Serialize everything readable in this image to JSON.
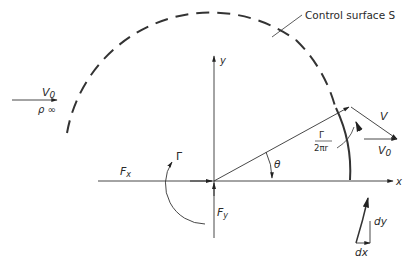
{
  "diagram": {
    "labels": {
      "control_surface": "Control surface S",
      "freestream_velocity": "V",
      "freestream_velocity_sub": "0",
      "freestream_density": "ρ ∞",
      "y_axis": "y",
      "x_axis": "x",
      "force_x": "F",
      "force_x_sub": "x",
      "force_y": "F",
      "force_y_sub": "y",
      "circulation": "Γ",
      "angle": "θ",
      "local_velocity": "V",
      "surface_velocity": "V",
      "surface_velocity_sub": "0",
      "swirl_numerator": "Γ",
      "swirl_denominator": "2πr",
      "dy": "dy",
      "dx": "dx"
    },
    "colors": {
      "line": "#333333",
      "background": "#ffffff"
    }
  }
}
